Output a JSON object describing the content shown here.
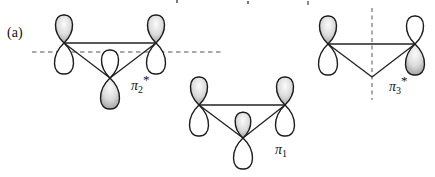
{
  "panel_label": "(a)",
  "diagram": {
    "structures": [
      {
        "id": "pi2-star",
        "label": {
          "base": "π",
          "sub": "2",
          "sup": "*"
        },
        "nodal_line": "horizontal-dashed",
        "atoms": [
          {
            "position": "top-left",
            "top_lobe": "shaded",
            "bottom_lobe": "white"
          },
          {
            "position": "top-right",
            "top_lobe": "shaded",
            "bottom_lobe": "white"
          },
          {
            "position": "bottom-center",
            "top_lobe": "white",
            "bottom_lobe": "shaded"
          }
        ]
      },
      {
        "id": "pi1",
        "label": {
          "base": "π",
          "sub": "1",
          "sup": ""
        },
        "nodal_line": "none",
        "atoms": [
          {
            "position": "top-left",
            "top_lobe": "shaded",
            "bottom_lobe": "white"
          },
          {
            "position": "top-right",
            "top_lobe": "shaded",
            "bottom_lobe": "white"
          },
          {
            "position": "bottom-center",
            "top_lobe": "shaded",
            "bottom_lobe": "white"
          }
        ]
      },
      {
        "id": "pi3-star",
        "label": {
          "base": "π",
          "sub": "3",
          "sup": "*"
        },
        "nodal_line": "vertical-dashed",
        "atoms": [
          {
            "position": "left",
            "top_lobe": "shaded",
            "bottom_lobe": "white"
          },
          {
            "position": "right",
            "top_lobe": "white",
            "bottom_lobe": "shaded"
          }
        ]
      }
    ]
  },
  "colors": {
    "background": "#ffffff",
    "outline": "#1c1c1c",
    "bond_line": "#222222",
    "dashed_nodal_line": "#8f8f8f",
    "lobe_highlight": "#fbfbfb",
    "lobe_shadow": "#6f6f6f",
    "label_text": "#111111"
  }
}
